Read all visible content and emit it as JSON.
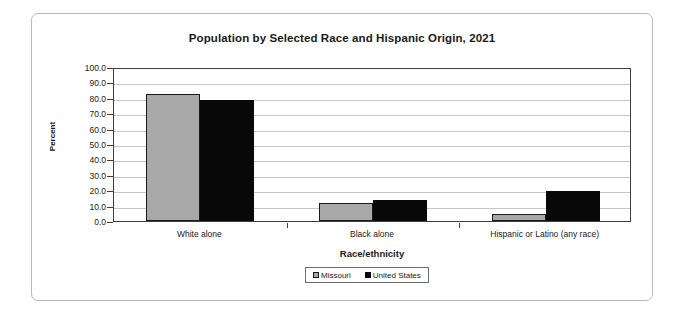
{
  "chart_data": {
    "type": "bar",
    "title": "Population by Selected Race and Hispanic Origin, 2021",
    "xlabel": "Race/ethnicity",
    "ylabel": "Percent",
    "ylim": [
      0.0,
      100.0
    ],
    "ytick_step": 10.0,
    "ytick_labels": [
      "100.0",
      "90.0",
      "80.0",
      "70.0",
      "60.0",
      "50.0",
      "40.0",
      "30.0",
      "20.0",
      "10.0",
      "0.0"
    ],
    "grid": true,
    "legend_position": "bottom-center",
    "categories": [
      "White alone",
      "Black alone",
      "Hispanic or Latino (any race)"
    ],
    "series": [
      {
        "name": "Missouri",
        "color": "#a8a8a8",
        "values": [
          82.5,
          11.8,
          4.8
        ]
      },
      {
        "name": "United States",
        "color": "#080808",
        "values": [
          78.8,
          13.6,
          19.5
        ]
      }
    ]
  }
}
